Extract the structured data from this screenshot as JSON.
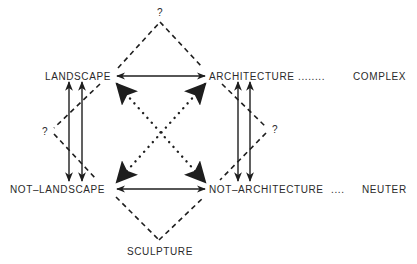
{
  "diagram": {
    "colors": {
      "ink": "#1e1e1e",
      "text": "#2a2a2a",
      "background": "#ffffff"
    },
    "terms": {
      "landscape": "LANDSCAPE",
      "architecture": "ARCHITECTURE",
      "not_landscape": "NOT–LANDSCAPE",
      "not_architecture": "NOT–ARCHITECTURE",
      "sculpture": "SCULPTURE"
    },
    "complex_term": {
      "leader": "........",
      "label": "COMPLEX"
    },
    "neuter_term": {
      "leader": "....",
      "label": "NEUTER"
    },
    "question_marks": {
      "top": "?",
      "left": "?",
      "right": "?"
    },
    "relations": [
      {
        "from": "LANDSCAPE",
        "to": "ARCHITECTURE",
        "style": "solid",
        "arrows": "both"
      },
      {
        "from": "NOT-LANDSCAPE",
        "to": "NOT-ARCHITECTURE",
        "style": "solid",
        "arrows": "both"
      },
      {
        "from": "LANDSCAPE",
        "to": "NOT-LANDSCAPE",
        "style": "solid-double",
        "arrows": "both"
      },
      {
        "from": "ARCHITECTURE",
        "to": "NOT-ARCHITECTURE",
        "style": "solid-double",
        "arrows": "both"
      },
      {
        "from": "LANDSCAPE",
        "to": "NOT-ARCHITECTURE",
        "style": "dotted",
        "arrows": "both"
      },
      {
        "from": "ARCHITECTURE",
        "to": "NOT-LANDSCAPE",
        "style": "dotted",
        "arrows": "both"
      },
      {
        "from": "LANDSCAPE",
        "to": "ARCHITECTURE",
        "style": "dashed-via-top",
        "vertex": "?"
      },
      {
        "from": "NOT-LANDSCAPE",
        "to": "NOT-ARCHITECTURE",
        "style": "dashed-via-bottom",
        "vertex": "SCULPTURE"
      },
      {
        "from": "LANDSCAPE",
        "to": "NOT-LANDSCAPE",
        "style": "dashed-via-left",
        "vertex": "?"
      },
      {
        "from": "ARCHITECTURE",
        "to": "NOT-ARCHITECTURE",
        "style": "dashed-via-right",
        "vertex": "?"
      }
    ]
  }
}
